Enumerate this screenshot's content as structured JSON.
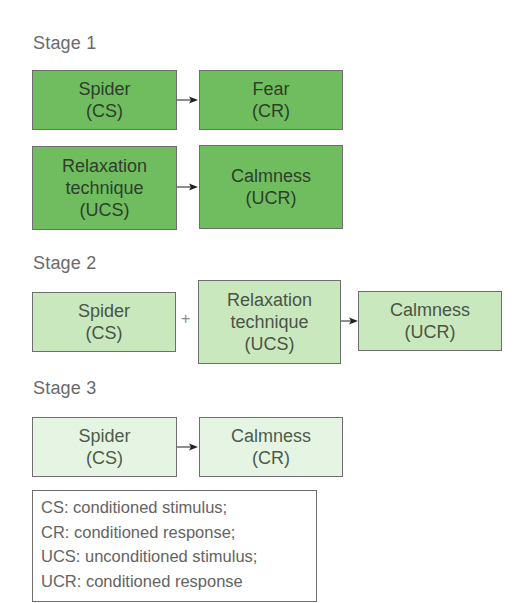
{
  "diagram": {
    "colors": {
      "stage1_fill": "#6fbd5e",
      "stage2_fill": "#c9e8be",
      "stage3_fill": "#e6f5e3",
      "border": "#6e6e6e",
      "text": "#4a4a4a"
    },
    "stages": [
      {
        "label": "Stage 1",
        "rows": [
          {
            "from": {
              "line1": "Spider",
              "line2": "(CS)"
            },
            "to": {
              "line1": "Fear",
              "line2": "(CR)"
            }
          },
          {
            "from": {
              "line1": "Relaxation",
              "line2": "technique",
              "line3": "(UCS)"
            },
            "to": {
              "line1": "Calmness",
              "line2": "(UCR)"
            }
          }
        ]
      },
      {
        "label": "Stage 2",
        "first": {
          "line1": "Spider",
          "line2": "(CS)"
        },
        "operator": "+",
        "second": {
          "line1": "Relaxation",
          "line2": "technique",
          "line3": "(UCS)"
        },
        "result": {
          "line1": "Calmness",
          "line2": "(UCR)"
        }
      },
      {
        "label": "Stage 3",
        "from": {
          "line1": "Spider",
          "line2": "(CS)"
        },
        "to": {
          "line1": "Calmness",
          "line2": "(CR)"
        }
      }
    ],
    "legend": [
      "CS: conditioned stimulus;",
      "CR: conditioned response;",
      "UCS: unconditioned stimulus;",
      "UCR: conditioned response"
    ]
  }
}
